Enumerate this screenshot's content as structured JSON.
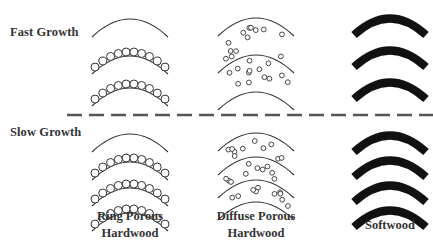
{
  "rows": [
    {
      "label": "Fast Growth",
      "x": 10,
      "y": 26
    },
    {
      "label": "Slow Growth",
      "x": 10,
      "y": 126
    }
  ],
  "columns": [
    {
      "line1": "Ring Porous",
      "line2": "Hardwood",
      "cx": 130,
      "label_y": 213
    },
    {
      "line1": "Diffuse Porous",
      "line2": "Hardwood",
      "cx": 256,
      "label_y": 213
    },
    {
      "line1": "Softwood",
      "line2": "",
      "cx": 390,
      "label_y": 223
    }
  ],
  "divider": {
    "style": "dashed",
    "y": 115,
    "x1": 67,
    "x2": 433,
    "color": "#555555"
  },
  "colors": {
    "ink": "#333333",
    "thick_ring": "#111111",
    "background": "#ffffff"
  },
  "panels": {
    "ring_porous_fast": {
      "type": "ring-porous",
      "cx": 130,
      "arc_ys": [
        19,
        56,
        88
      ],
      "pore_rows": [
        56,
        88
      ],
      "pores_per_row": 10
    },
    "ring_porous_slow": {
      "type": "ring-porous",
      "cx": 130,
      "arc_ys": [
        134,
        162,
        188,
        213
      ],
      "pore_rows": [
        162,
        188,
        213
      ],
      "pores_per_row": 10
    },
    "diffuse_porous_fast": {
      "type": "diffuse-porous",
      "cx": 256,
      "arc_ys": [
        18,
        55,
        92
      ]
    },
    "diffuse_porous_slow": {
      "type": "diffuse-porous",
      "cx": 256,
      "arc_ys": [
        133,
        157,
        180,
        202
      ]
    },
    "softwood_fast": {
      "type": "softwood",
      "cx": 390,
      "band_ys": [
        18,
        50,
        82
      ],
      "band_count": 3
    },
    "softwood_slow": {
      "type": "softwood",
      "cx": 390,
      "band_ys": [
        135,
        160,
        185,
        210
      ],
      "band_count": 4
    }
  }
}
